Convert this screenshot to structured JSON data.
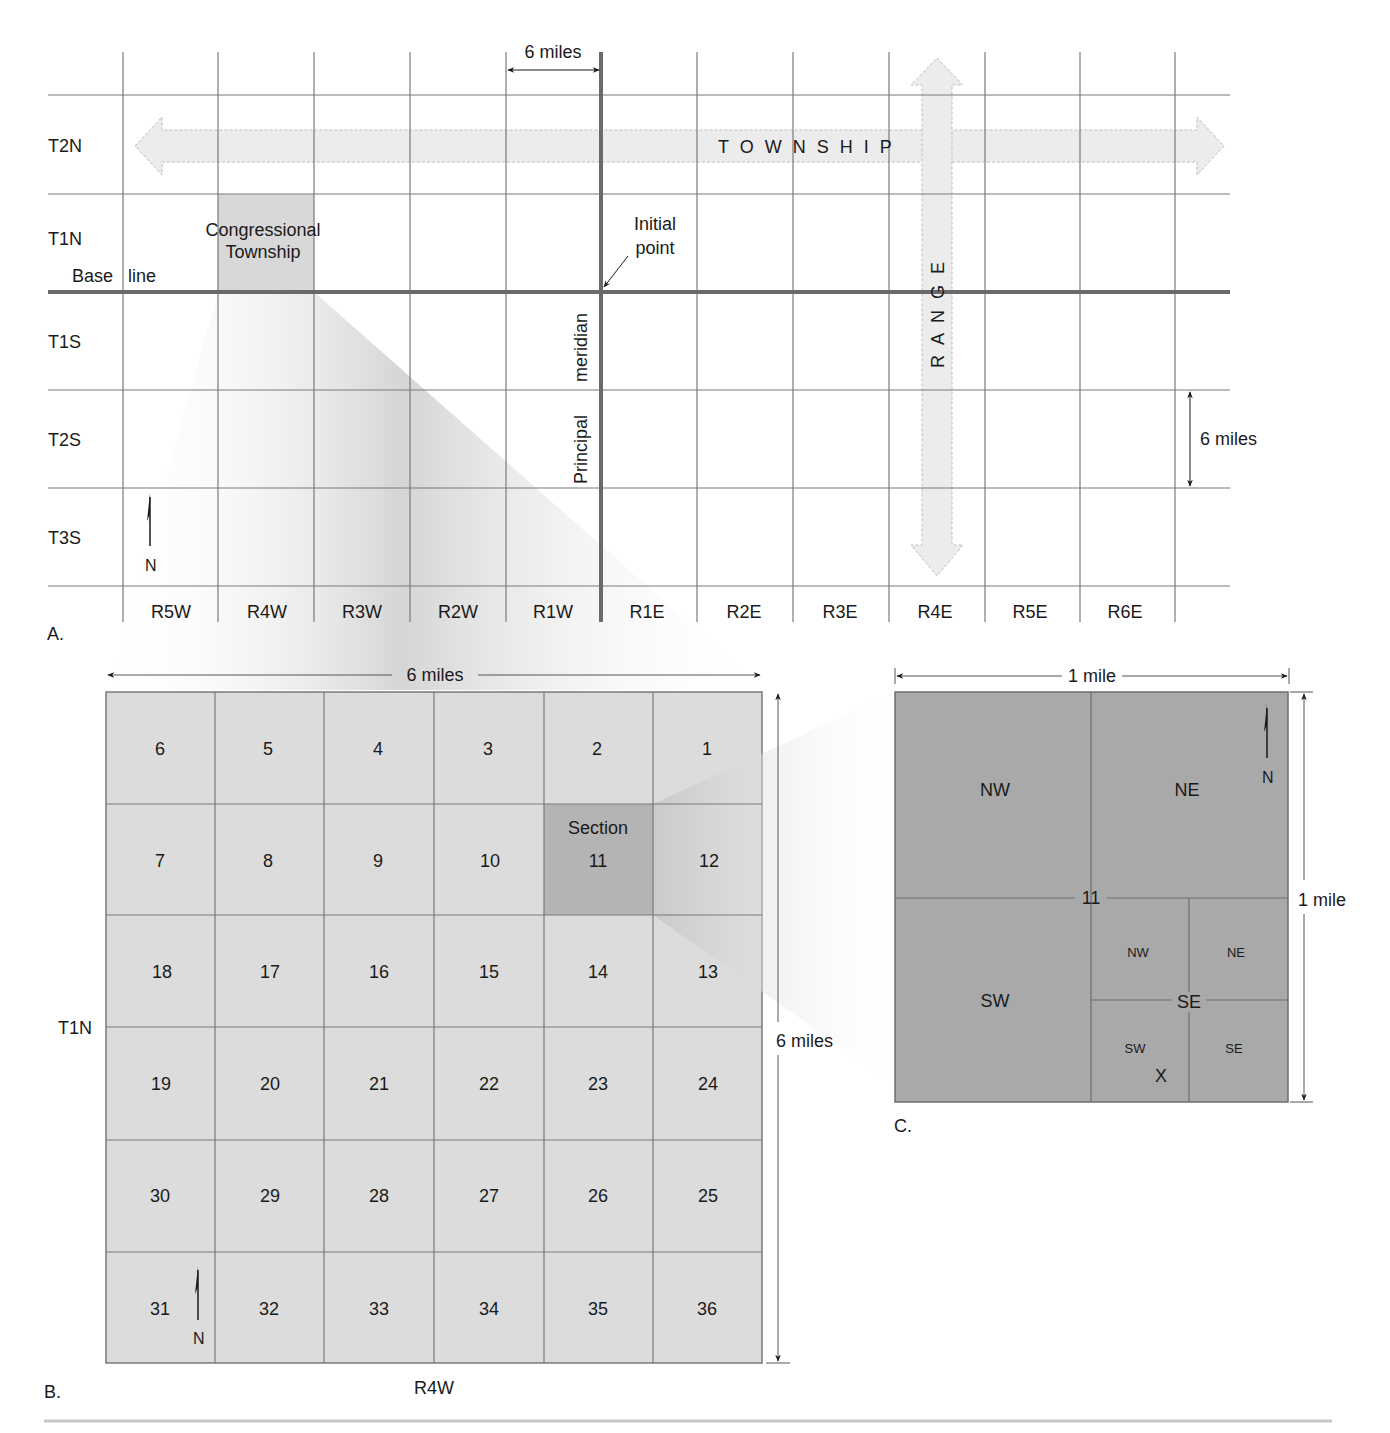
{
  "panel_a": {
    "letter": "A.",
    "township_rows": [
      "T2N",
      "T1N",
      "T1S",
      "T2S",
      "T3S"
    ],
    "range_cols": [
      "R5W",
      "R4W",
      "R3W",
      "R2W",
      "R1W",
      "R1E",
      "R2E",
      "R3E",
      "R4E",
      "R5E",
      "R6E"
    ],
    "top_dimension": "6 miles",
    "side_dimension": "6 miles",
    "township_arrow": "T O W N S H I P",
    "range_arrow": "R A N G E",
    "congressional_township_line1": "Congressional",
    "congressional_township_line2": "Township",
    "initial_point_line1": "Initial",
    "initial_point_line2": "point",
    "base_line_word1": "Base",
    "base_line_word2": "line",
    "meridian_word1": "Principal",
    "meridian_word2": "meridian",
    "north": "N"
  },
  "panel_b": {
    "letter": "B.",
    "top_dimension": "6 miles",
    "side_dimension": "6 miles",
    "township_label": "T1N",
    "range_label": "R4W",
    "section_word": "Section",
    "north": "N",
    "sections": [
      [
        "6",
        "5",
        "4",
        "3",
        "2",
        "1"
      ],
      [
        "7",
        "8",
        "9",
        "10",
        "11",
        "12"
      ],
      [
        "18",
        "17",
        "16",
        "15",
        "14",
        "13"
      ],
      [
        "19",
        "20",
        "21",
        "22",
        "23",
        "24"
      ],
      [
        "30",
        "29",
        "28",
        "27",
        "26",
        "25"
      ],
      [
        "31",
        "32",
        "33",
        "34",
        "35",
        "36"
      ]
    ],
    "highlighted_section": "11"
  },
  "panel_c": {
    "letter": "C.",
    "top_dimension": "1 mile",
    "side_dimension": "1 mile",
    "section_number": "11",
    "north": "N",
    "quarters": {
      "nw": "NW",
      "ne": "NE",
      "sw": "SW",
      "se": "SE"
    },
    "se_subquarters": {
      "nw": "NW",
      "ne": "NE",
      "sw": "SW",
      "se": "SE"
    },
    "marker": "X"
  },
  "colors": {
    "grid_line": "#777777",
    "baseline_meridian": "#6e6e6e",
    "arrow_fill": "#ececec",
    "township_fill": "#dadada",
    "section_b_fill": "#dcdcdc",
    "section11_fill": "#b4b4b4",
    "section_c_fill": "#a9a9a9"
  }
}
